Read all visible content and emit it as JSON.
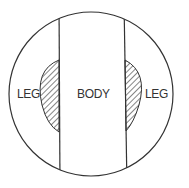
{
  "diagram": {
    "labels": {
      "left": "LEG",
      "center": "BODY",
      "right": "LEG"
    },
    "colors": {
      "stroke": "#333333",
      "background": "#ffffff"
    }
  }
}
